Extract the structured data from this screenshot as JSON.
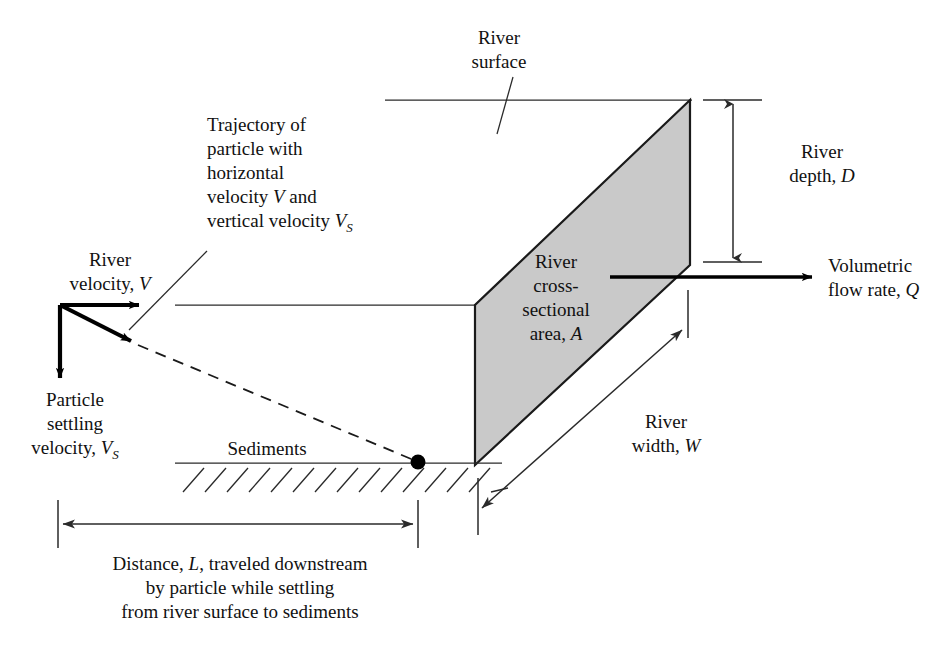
{
  "figure": {
    "type": "engineering-schematic",
    "background_color": "#ffffff",
    "line_color": "#1a1a1a",
    "shade_color": "#c9c9c9"
  },
  "labels": {
    "river_surface": {
      "line1": "River",
      "line2": "surface"
    },
    "trajectory": {
      "line1": "Trajectory of",
      "line2": "particle with",
      "line3": "horizontal",
      "line4_pre": "velocity ",
      "line4_sym": "V",
      "line4_post": " and",
      "line5_pre": "vertical velocity ",
      "line5_sym": "V",
      "line5_sub": "S"
    },
    "river_velocity": {
      "line1": "River",
      "line2_pre": "velocity, ",
      "line2_sym": "V"
    },
    "particle_settling": {
      "line1": "Particle",
      "line2": "settling",
      "line3_pre": "velocity, ",
      "line3_sym": "V",
      "line3_sub": "S"
    },
    "sediments": {
      "text": "Sediments"
    },
    "cross_section": {
      "line1": "River",
      "line2": "cross-",
      "line3": "sectional",
      "line4_pre": "area, ",
      "line4_sym": "A"
    },
    "river_depth": {
      "line1": "River",
      "line2_pre": "depth, ",
      "line2_sym": "D"
    },
    "river_width": {
      "line1": "River",
      "line2_pre": "width, ",
      "line2_sym": "W"
    },
    "volumetric_flow": {
      "line1": "Volumetric",
      "line2_pre": "flow rate, ",
      "line2_sym": "Q"
    },
    "distance_caption": {
      "line1_pre": "Distance, ",
      "line1_sym": "L",
      "line1_post": ", traveled downstream",
      "line2": "by particle while settling",
      "line3": "from river surface to sediments"
    }
  },
  "symbols": {
    "V": "V",
    "Vs": "V_S",
    "D": "D",
    "W": "W",
    "A": "A",
    "Q": "Q",
    "L": "L"
  },
  "geometry": {
    "river_surface_back_line": {
      "x1": 385,
      "y1": 100,
      "x2": 690,
      "y2": 100
    },
    "river_surface_front_line": {
      "x1": 175,
      "y1": 305,
      "x2": 475,
      "y2": 305
    },
    "sediment_line": {
      "x1": 175,
      "y1": 463,
      "x2": 500,
      "y2": 463
    },
    "cross_section_polygon": "690,100 690,265 475,465 475,305",
    "particle_dot": {
      "cx": 418,
      "cy": 462,
      "r": 7
    },
    "depth_dimension": {
      "x": 733,
      "y_top": 100,
      "y_bottom": 262
    },
    "width_dimension": {
      "x1": 478,
      "y1": 512,
      "x2": 685,
      "y2": 326
    },
    "length_dimension": {
      "x1": 58,
      "x2": 418,
      "y": 524
    },
    "flow_arrow": {
      "x1": 610,
      "y1": 277,
      "x2": 815,
      "y2": 277
    },
    "velocity_origin": {
      "x": 60,
      "y": 305
    }
  }
}
